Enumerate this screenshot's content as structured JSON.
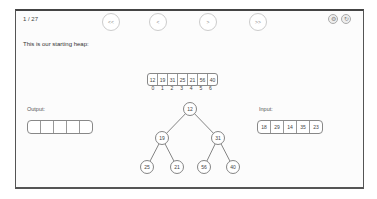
{
  "header": {
    "step_counter": "1 / 27",
    "caption": "This is our starting heap:"
  },
  "nav": {
    "first": "<<",
    "prev": "<",
    "next": ">",
    "last": ">>"
  },
  "top_icons": [
    {
      "name": "settings-icon",
      "glyph": "⚙"
    },
    {
      "name": "refresh-icon",
      "glyph": "↻"
    }
  ],
  "heap_array": {
    "values": [
      "12",
      "19",
      "31",
      "25",
      "21",
      "56",
      "40"
    ],
    "indices": [
      "0",
      "1",
      "2",
      "3",
      "4",
      "5",
      "6"
    ]
  },
  "output": {
    "label": "Output:",
    "cells": [
      "",
      "",
      "",
      "",
      ""
    ]
  },
  "input": {
    "label": "Input:",
    "cells": [
      "18",
      "29",
      "14",
      "35",
      "23"
    ]
  },
  "tree": {
    "nodes": [
      {
        "value": "12",
        "x": 190,
        "y": 109
      },
      {
        "value": "19",
        "x": 162,
        "y": 138
      },
      {
        "value": "31",
        "x": 218,
        "y": 138
      },
      {
        "value": "25",
        "x": 147,
        "y": 167
      },
      {
        "value": "21",
        "x": 177,
        "y": 167
      },
      {
        "value": "56",
        "x": 204,
        "y": 167
      },
      {
        "value": "40",
        "x": 233,
        "y": 167
      }
    ],
    "edges": [
      [
        0,
        1
      ],
      [
        0,
        2
      ],
      [
        1,
        3
      ],
      [
        1,
        4
      ],
      [
        2,
        5
      ],
      [
        2,
        6
      ]
    ]
  },
  "colors": {
    "border": "#555555",
    "node_stroke": "#777777",
    "node_fill": "#ffffff"
  }
}
